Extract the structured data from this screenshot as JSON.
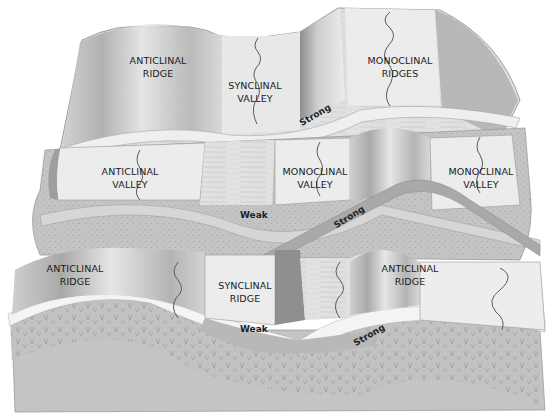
{
  "diagram": {
    "style": "grayscale illustration",
    "colors": {
      "background": "#ffffff",
      "surface_light": "#ededed",
      "surface_mid": "#c9c9c9",
      "surface_dark": "#9a9a9a",
      "strong_layer": "#f2f2f2",
      "weak_layer": "#bdbdbd",
      "stream": "#5a5a5a",
      "label_text": "#1a1a1a"
    },
    "stages": [
      {
        "name": "upper-block",
        "landforms": [
          {
            "id": "anticlinal-ridge-top",
            "line1": "ANTICLINAL",
            "line2": "RIDGE"
          },
          {
            "id": "synclinal-valley-top",
            "line1": "SYNCLINAL",
            "line2": "VALLEY"
          },
          {
            "id": "monoclinal-ridges-top",
            "line1": "MONOCLINAL",
            "line2": "RIDGES"
          }
        ],
        "layer_labels": [
          {
            "id": "strong-top",
            "text": "Strong"
          }
        ]
      },
      {
        "name": "middle-block",
        "landforms": [
          {
            "id": "anticlinal-valley-mid",
            "line1": "ANTICLINAL",
            "line2": "VALLEY"
          },
          {
            "id": "monoclinal-valley-mid-left",
            "line1": "MONOCLINAL",
            "line2": "VALLEY"
          },
          {
            "id": "monoclinal-valley-mid-right",
            "line1": "MONOCLINAL",
            "line2": "VALLEY"
          }
        ],
        "layer_labels": [
          {
            "id": "weak-mid",
            "text": "Weak"
          },
          {
            "id": "strong-mid",
            "text": "Strong"
          }
        ]
      },
      {
        "name": "lower-block",
        "landforms": [
          {
            "id": "anticlinal-ridge-low-left",
            "line1": "ANTICLINAL",
            "line2": "RIDGE"
          },
          {
            "id": "synclinal-ridge-low",
            "line1": "SYNCLINAL",
            "line2": "RIDGE"
          },
          {
            "id": "anticlinal-ridge-low-right",
            "line1": "ANTICLINAL",
            "line2": "RIDGE"
          }
        ],
        "layer_labels": [
          {
            "id": "weak-low",
            "text": "Weak"
          },
          {
            "id": "strong-low",
            "text": "Strong"
          }
        ]
      }
    ]
  }
}
